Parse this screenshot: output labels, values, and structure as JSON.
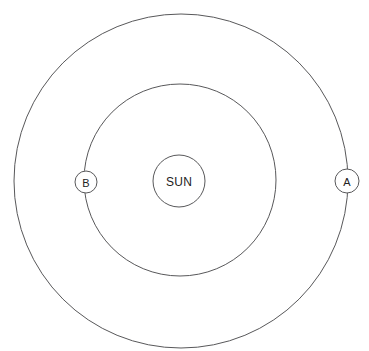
{
  "diagram": {
    "type": "orbital-diagram",
    "title": "",
    "background_color": "#ffffff",
    "stroke_color": "#58585a",
    "text_color": "#222222",
    "canvas": {
      "width": 369,
      "height": 351
    },
    "center": {
      "x": 180,
      "y": 181
    },
    "sun": {
      "label": "SUN",
      "cx": 179,
      "cy": 181,
      "r": 26
    },
    "orbits": [
      {
        "name": "inner-orbit",
        "cx": 180,
        "cy": 180,
        "r": 96
      },
      {
        "name": "outer-orbit",
        "cx": 181,
        "cy": 181,
        "r": 167
      }
    ],
    "markers": [
      {
        "name": "planet-b",
        "label": "B",
        "cx": 86,
        "cy": 182,
        "r": 11,
        "orbit": "inner-orbit",
        "position": "left"
      },
      {
        "name": "planet-a",
        "label": "A",
        "cx": 347,
        "cy": 181,
        "r": 12,
        "orbit": "outer-orbit",
        "position": "right"
      }
    ]
  }
}
